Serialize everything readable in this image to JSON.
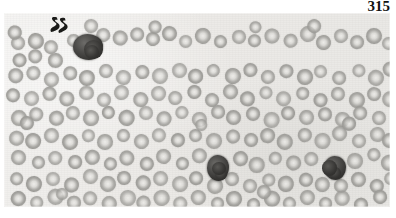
{
  "page": {
    "number": "315",
    "background_color": "#ffffff"
  },
  "figure": {
    "name": "blood-smear-micrograph",
    "kind": "photomicrograph",
    "caption": "",
    "plate": {
      "x": 4,
      "y": 13,
      "width": 386,
      "height": 194
    },
    "colors": {
      "background": "#eeedeb",
      "erythrocyte": "#a3a29e",
      "erythrocyte_pallor": "#eeedea",
      "nucleated_cell": "#343331",
      "marker_ink": "#1a1a18",
      "page_number": "#111111"
    },
    "annotations": [
      {
        "name": "s-marker",
        "label": "S",
        "x": 44,
        "y": 2,
        "width": 22,
        "height": 20
      }
    ],
    "nucleated_cells": [
      {
        "name": "nucleated-cell-top-left",
        "cx": 84,
        "cy": 34,
        "rx": 15,
        "ry": 13,
        "lobes": 3
      },
      {
        "name": "nucleated-cell-center",
        "cx": 214,
        "cy": 155,
        "rx": 11,
        "ry": 13,
        "lobes": 2
      },
      {
        "name": "nucleated-cell-right",
        "cx": 331,
        "cy": 155,
        "rx": 11,
        "ry": 12,
        "lobes": 2
      }
    ],
    "erythrocytes": [
      {
        "cx": 14,
        "cy": 30,
        "r": 7.5
      },
      {
        "cx": 31,
        "cy": 27,
        "r": 8
      },
      {
        "cx": 47,
        "cy": 34,
        "r": 7
      },
      {
        "cx": 15,
        "cy": 46,
        "r": 7.5
      },
      {
        "cx": 32,
        "cy": 44,
        "r": 7
      },
      {
        "cx": 53,
        "cy": 48,
        "r": 7.5
      },
      {
        "cx": 68,
        "cy": 27,
        "r": 7
      },
      {
        "cx": 100,
        "cy": 22,
        "r": 7.5
      },
      {
        "cx": 117,
        "cy": 26,
        "r": 7
      },
      {
        "cx": 133,
        "cy": 21,
        "r": 7.5
      },
      {
        "cx": 150,
        "cy": 27,
        "r": 7
      },
      {
        "cx": 166,
        "cy": 22,
        "r": 7.5
      },
      {
        "cx": 183,
        "cy": 28,
        "r": 7
      },
      {
        "cx": 200,
        "cy": 22,
        "r": 7.5
      },
      {
        "cx": 217,
        "cy": 28,
        "r": 7
      },
      {
        "cx": 234,
        "cy": 23,
        "r": 7.5
      },
      {
        "cx": 251,
        "cy": 29,
        "r": 7
      },
      {
        "cx": 268,
        "cy": 23,
        "r": 7.5
      },
      {
        "cx": 286,
        "cy": 28,
        "r": 7
      },
      {
        "cx": 303,
        "cy": 22,
        "r": 7.5
      },
      {
        "cx": 320,
        "cy": 29,
        "r": 7
      },
      {
        "cx": 337,
        "cy": 23,
        "r": 7.5
      },
      {
        "cx": 354,
        "cy": 29,
        "r": 7
      },
      {
        "cx": 371,
        "cy": 23,
        "r": 7.5
      },
      {
        "cx": 385,
        "cy": 31,
        "r": 7
      },
      {
        "cx": 12,
        "cy": 63,
        "r": 7.5
      },
      {
        "cx": 30,
        "cy": 61,
        "r": 7
      },
      {
        "cx": 48,
        "cy": 66,
        "r": 7.5
      },
      {
        "cx": 66,
        "cy": 60,
        "r": 7
      },
      {
        "cx": 84,
        "cy": 64,
        "r": 7.5
      },
      {
        "cx": 103,
        "cy": 58,
        "r": 7
      },
      {
        "cx": 120,
        "cy": 64,
        "r": 7.5
      },
      {
        "cx": 138,
        "cy": 58,
        "r": 7
      },
      {
        "cx": 156,
        "cy": 64,
        "r": 7.5
      },
      {
        "cx": 174,
        "cy": 58,
        "r": 7
      },
      {
        "cx": 192,
        "cy": 64,
        "r": 7.5
      },
      {
        "cx": 210,
        "cy": 58,
        "r": 7
      },
      {
        "cx": 228,
        "cy": 64,
        "r": 7.5
      },
      {
        "cx": 246,
        "cy": 58,
        "r": 7
      },
      {
        "cx": 264,
        "cy": 64,
        "r": 7.5
      },
      {
        "cx": 282,
        "cy": 58,
        "r": 7
      },
      {
        "cx": 300,
        "cy": 64,
        "r": 7.5
      },
      {
        "cx": 318,
        "cy": 58,
        "r": 7
      },
      {
        "cx": 336,
        "cy": 64,
        "r": 7.5
      },
      {
        "cx": 354,
        "cy": 58,
        "r": 7
      },
      {
        "cx": 372,
        "cy": 64,
        "r": 7.5
      },
      {
        "cx": 386,
        "cy": 57,
        "r": 7
      },
      {
        "cx": 10,
        "cy": 82,
        "r": 7
      },
      {
        "cx": 28,
        "cy": 86,
        "r": 7.5
      },
      {
        "cx": 46,
        "cy": 80,
        "r": 7
      },
      {
        "cx": 64,
        "cy": 86,
        "r": 7.5
      },
      {
        "cx": 82,
        "cy": 80,
        "r": 7
      },
      {
        "cx": 100,
        "cy": 86,
        "r": 7.5
      },
      {
        "cx": 118,
        "cy": 80,
        "r": 7
      },
      {
        "cx": 136,
        "cy": 86,
        "r": 7.5
      },
      {
        "cx": 154,
        "cy": 80,
        "r": 7
      },
      {
        "cx": 172,
        "cy": 86,
        "r": 7.5
      },
      {
        "cx": 190,
        "cy": 80,
        "r": 7
      },
      {
        "cx": 208,
        "cy": 86,
        "r": 7.5
      },
      {
        "cx": 226,
        "cy": 80,
        "r": 7
      },
      {
        "cx": 244,
        "cy": 86,
        "r": 7.5
      },
      {
        "cx": 262,
        "cy": 80,
        "r": 7
      },
      {
        "cx": 280,
        "cy": 86,
        "r": 7.5
      },
      {
        "cx": 298,
        "cy": 80,
        "r": 7
      },
      {
        "cx": 316,
        "cy": 86,
        "r": 7.5
      },
      {
        "cx": 334,
        "cy": 80,
        "r": 7
      },
      {
        "cx": 352,
        "cy": 86,
        "r": 7.5
      },
      {
        "cx": 370,
        "cy": 80,
        "r": 7
      },
      {
        "cx": 386,
        "cy": 86,
        "r": 7.5
      },
      {
        "cx": 14,
        "cy": 104,
        "r": 7.5
      },
      {
        "cx": 33,
        "cy": 100,
        "r": 7
      },
      {
        "cx": 51,
        "cy": 106,
        "r": 7.5
      },
      {
        "cx": 69,
        "cy": 100,
        "r": 7
      },
      {
        "cx": 87,
        "cy": 106,
        "r": 7.5
      },
      {
        "cx": 105,
        "cy": 100,
        "r": 7
      },
      {
        "cx": 123,
        "cy": 106,
        "r": 7.5
      },
      {
        "cx": 141,
        "cy": 100,
        "r": 7
      },
      {
        "cx": 159,
        "cy": 106,
        "r": 7.5
      },
      {
        "cx": 177,
        "cy": 100,
        "r": 7
      },
      {
        "cx": 195,
        "cy": 106,
        "r": 7.5
      },
      {
        "cx": 213,
        "cy": 100,
        "r": 7
      },
      {
        "cx": 231,
        "cy": 106,
        "r": 7.5
      },
      {
        "cx": 249,
        "cy": 100,
        "r": 7
      },
      {
        "cx": 267,
        "cy": 106,
        "r": 7.5
      },
      {
        "cx": 285,
        "cy": 100,
        "r": 7
      },
      {
        "cx": 303,
        "cy": 106,
        "r": 7.5
      },
      {
        "cx": 321,
        "cy": 100,
        "r": 7
      },
      {
        "cx": 339,
        "cy": 106,
        "r": 7.5
      },
      {
        "cx": 357,
        "cy": 100,
        "r": 7
      },
      {
        "cx": 375,
        "cy": 106,
        "r": 7.5
      },
      {
        "cx": 12,
        "cy": 124,
        "r": 7
      },
      {
        "cx": 30,
        "cy": 128,
        "r": 7.5
      },
      {
        "cx": 48,
        "cy": 122,
        "r": 7
      },
      {
        "cx": 66,
        "cy": 128,
        "r": 7.5
      },
      {
        "cx": 84,
        "cy": 122,
        "r": 7
      },
      {
        "cx": 102,
        "cy": 128,
        "r": 7.5
      },
      {
        "cx": 120,
        "cy": 122,
        "r": 7
      },
      {
        "cx": 138,
        "cy": 128,
        "r": 7.5
      },
      {
        "cx": 156,
        "cy": 122,
        "r": 7
      },
      {
        "cx": 174,
        "cy": 128,
        "r": 7.5
      },
      {
        "cx": 192,
        "cy": 122,
        "r": 7
      },
      {
        "cx": 210,
        "cy": 128,
        "r": 7.5
      },
      {
        "cx": 228,
        "cy": 122,
        "r": 7
      },
      {
        "cx": 246,
        "cy": 128,
        "r": 7.5
      },
      {
        "cx": 264,
        "cy": 122,
        "r": 7
      },
      {
        "cx": 282,
        "cy": 128,
        "r": 7.5
      },
      {
        "cx": 300,
        "cy": 122,
        "r": 7
      },
      {
        "cx": 318,
        "cy": 128,
        "r": 7.5
      },
      {
        "cx": 336,
        "cy": 122,
        "r": 7
      },
      {
        "cx": 354,
        "cy": 128,
        "r": 7.5
      },
      {
        "cx": 372,
        "cy": 122,
        "r": 7
      },
      {
        "cx": 386,
        "cy": 128,
        "r": 7
      },
      {
        "cx": 15,
        "cy": 146,
        "r": 7.5
      },
      {
        "cx": 34,
        "cy": 150,
        "r": 7
      },
      {
        "cx": 52,
        "cy": 144,
        "r": 7.5
      },
      {
        "cx": 70,
        "cy": 150,
        "r": 7
      },
      {
        "cx": 88,
        "cy": 144,
        "r": 7.5
      },
      {
        "cx": 106,
        "cy": 150,
        "r": 7
      },
      {
        "cx": 124,
        "cy": 144,
        "r": 7.5
      },
      {
        "cx": 142,
        "cy": 150,
        "r": 7
      },
      {
        "cx": 160,
        "cy": 144,
        "r": 7.5
      },
      {
        "cx": 178,
        "cy": 150,
        "r": 7
      },
      {
        "cx": 196,
        "cy": 144,
        "r": 7.5
      },
      {
        "cx": 236,
        "cy": 146,
        "r": 7
      },
      {
        "cx": 254,
        "cy": 151,
        "r": 7.5
      },
      {
        "cx": 272,
        "cy": 145,
        "r": 7
      },
      {
        "cx": 290,
        "cy": 151,
        "r": 7.5
      },
      {
        "cx": 308,
        "cy": 145,
        "r": 7
      },
      {
        "cx": 352,
        "cy": 148,
        "r": 7.5
      },
      {
        "cx": 370,
        "cy": 143,
        "r": 7
      },
      {
        "cx": 385,
        "cy": 150,
        "r": 7.5
      },
      {
        "cx": 12,
        "cy": 166,
        "r": 7
      },
      {
        "cx": 31,
        "cy": 170,
        "r": 7.5
      },
      {
        "cx": 49,
        "cy": 165,
        "r": 7
      },
      {
        "cx": 67,
        "cy": 171,
        "r": 7.5
      },
      {
        "cx": 85,
        "cy": 165,
        "r": 7
      },
      {
        "cx": 103,
        "cy": 171,
        "r": 7.5
      },
      {
        "cx": 121,
        "cy": 165,
        "r": 7
      },
      {
        "cx": 139,
        "cy": 171,
        "r": 7.5
      },
      {
        "cx": 157,
        "cy": 165,
        "r": 7
      },
      {
        "cx": 175,
        "cy": 171,
        "r": 7.5
      },
      {
        "cx": 193,
        "cy": 165,
        "r": 7
      },
      {
        "cx": 211,
        "cy": 173,
        "r": 7.5
      },
      {
        "cx": 229,
        "cy": 166,
        "r": 7
      },
      {
        "cx": 247,
        "cy": 172,
        "r": 7.5
      },
      {
        "cx": 265,
        "cy": 166,
        "r": 7
      },
      {
        "cx": 283,
        "cy": 172,
        "r": 7.5
      },
      {
        "cx": 301,
        "cy": 166,
        "r": 7
      },
      {
        "cx": 319,
        "cy": 172,
        "r": 7.5
      },
      {
        "cx": 337,
        "cy": 172,
        "r": 7
      },
      {
        "cx": 355,
        "cy": 166,
        "r": 7.5
      },
      {
        "cx": 373,
        "cy": 172,
        "r": 7
      },
      {
        "cx": 386,
        "cy": 165,
        "r": 7
      },
      {
        "cx": 14,
        "cy": 186,
        "r": 7.5
      },
      {
        "cx": 33,
        "cy": 190,
        "r": 7
      },
      {
        "cx": 51,
        "cy": 185,
        "r": 7.5
      },
      {
        "cx": 69,
        "cy": 191,
        "r": 7
      },
      {
        "cx": 87,
        "cy": 185,
        "r": 7.5
      },
      {
        "cx": 105,
        "cy": 191,
        "r": 7
      },
      {
        "cx": 123,
        "cy": 185,
        "r": 7.5
      },
      {
        "cx": 141,
        "cy": 191,
        "r": 7
      },
      {
        "cx": 159,
        "cy": 185,
        "r": 7.5
      },
      {
        "cx": 177,
        "cy": 191,
        "r": 7
      },
      {
        "cx": 195,
        "cy": 185,
        "r": 7.5
      },
      {
        "cx": 213,
        "cy": 191,
        "r": 7
      },
      {
        "cx": 231,
        "cy": 185,
        "r": 7.5
      },
      {
        "cx": 249,
        "cy": 191,
        "r": 7
      },
      {
        "cx": 267,
        "cy": 185,
        "r": 7.5
      },
      {
        "cx": 285,
        "cy": 191,
        "r": 7
      },
      {
        "cx": 303,
        "cy": 185,
        "r": 7.5
      },
      {
        "cx": 321,
        "cy": 191,
        "r": 7
      },
      {
        "cx": 339,
        "cy": 185,
        "r": 7.5
      },
      {
        "cx": 357,
        "cy": 191,
        "r": 7
      },
      {
        "cx": 375,
        "cy": 185,
        "r": 7.5
      },
      {
        "cx": 10,
        "cy": 20,
        "r": 6.5
      },
      {
        "cx": 86,
        "cy": 14,
        "r": 6.5
      },
      {
        "cx": 250,
        "cy": 14,
        "r": 6.5
      },
      {
        "cx": 310,
        "cy": 14,
        "r": 6.5
      },
      {
        "cx": 150,
        "cy": 14,
        "r": 6.5
      },
      {
        "cx": 22,
        "cy": 110,
        "r": 6.5
      },
      {
        "cx": 198,
        "cy": 112,
        "r": 6.5
      },
      {
        "cx": 344,
        "cy": 112,
        "r": 6.5
      },
      {
        "cx": 58,
        "cy": 180,
        "r": 6.5
      },
      {
        "cx": 260,
        "cy": 180,
        "r": 6.5
      }
    ]
  }
}
